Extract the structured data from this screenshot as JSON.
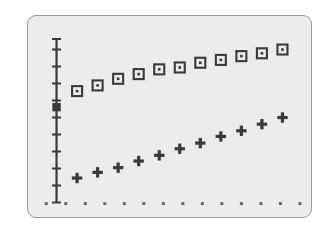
{
  "figure": {
    "background_color": "#ffffff",
    "panel_background_color": "#ececec",
    "panel_border_color": "#9a9a9a",
    "marker_color": "#3a3a3a",
    "axis_color": "#3a3a3a"
  },
  "chart_data": {
    "type": "scatter",
    "title": "",
    "xlabel": "",
    "ylabel": "",
    "grid": false,
    "legend_position": "none",
    "xlim": [
      0,
      13
    ],
    "ylim": [
      0,
      10
    ],
    "axis": {
      "y_axis_visible": true,
      "x_axis_visible": false,
      "y_axis_x_position": 1.0,
      "y_axis_range": [
        0.55,
        9.2
      ],
      "y_tick_values": [
        0.55,
        1.45,
        2.35,
        3.25,
        4.15,
        5.05,
        5.95,
        6.85,
        7.75,
        8.65,
        9.2
      ],
      "y_axis_marker_value": 5.6,
      "y_axis_marker_style": "filled-square"
    },
    "series": [
      {
        "name": "squares",
        "marker": "open-square-with-center-dot",
        "color": "#3a3a3a",
        "x": [
          2,
          3,
          4,
          5,
          6,
          7,
          8,
          9,
          10,
          11,
          12
        ],
        "y": [
          6.45,
          6.75,
          7.1,
          7.35,
          7.6,
          7.7,
          7.95,
          8.1,
          8.3,
          8.45,
          8.65
        ]
      },
      {
        "name": "pluses",
        "marker": "plus",
        "color": "#3a3a3a",
        "x": [
          2,
          3,
          4,
          5,
          6,
          7,
          8,
          9,
          10,
          11,
          12
        ],
        "y": [
          1.85,
          2.15,
          2.4,
          2.75,
          3.05,
          3.4,
          3.7,
          4.05,
          4.35,
          4.7,
          5.05
        ]
      },
      {
        "name": "baseline-dots",
        "marker": "dot",
        "color": "#6a6a6a",
        "x": [
          0.5,
          1.45,
          2.4,
          3.35,
          4.3,
          5.25,
          6.2,
          7.15,
          8.1,
          9.05,
          10.0,
          10.95,
          11.9,
          12.85
        ],
        "y": [
          0.5,
          0.5,
          0.5,
          0.5,
          0.5,
          0.5,
          0.5,
          0.5,
          0.5,
          0.5,
          0.5,
          0.5,
          0.5,
          0.5
        ]
      }
    ]
  }
}
